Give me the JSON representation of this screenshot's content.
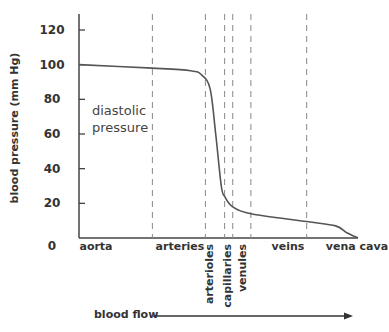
{
  "chart_data": {
    "type": "line",
    "title": "",
    "ylabel": "blood pressure (mm Hg)",
    "xlabel": "blood flow",
    "ylim": [
      0,
      120
    ],
    "yticks": [
      0,
      20,
      40,
      60,
      80,
      100,
      120
    ],
    "annotation": [
      "diastolic",
      "pressure"
    ],
    "regions": [
      {
        "label": "aorta",
        "vertical": false
      },
      {
        "label": "arteries",
        "vertical": false
      },
      {
        "label": "arterioles",
        "vertical": true
      },
      {
        "label": "capillaries",
        "vertical": true
      },
      {
        "label": "venules",
        "vertical": true
      },
      {
        "label": "veins",
        "vertical": false
      },
      {
        "label": "vena cava",
        "vertical": false
      }
    ],
    "boundaries": [
      0.263,
      0.453,
      0.522,
      0.551,
      0.616,
      0.816
    ],
    "series": [
      {
        "name": "diastolic pressure",
        "x": [
          0.0,
          0.263,
          0.4,
          0.44,
          0.47,
          0.49,
          0.51,
          0.522,
          0.551,
          0.616,
          0.816,
          0.92,
          0.96,
          1.0
        ],
        "values": [
          100,
          98,
          96.5,
          94,
          86,
          60,
          30,
          24,
          18,
          14,
          9.5,
          7,
          3,
          0
        ]
      }
    ]
  }
}
